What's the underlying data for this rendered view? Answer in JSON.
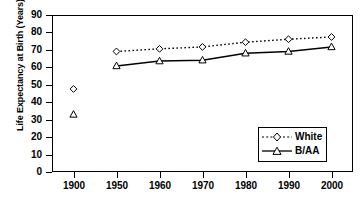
{
  "chart_data": {
    "type": "line",
    "title": "",
    "xlabel": "Year",
    "ylabel": "Life Expectancy at Birth (Years)",
    "categories": [
      "1900",
      "1950",
      "1960",
      "1970",
      "1980",
      "1990",
      "2000"
    ],
    "x_tick_labels": [
      "1900",
      "1950",
      "1960",
      "1970",
      "1980",
      "1990",
      "2000"
    ],
    "y_tick_labels": [
      "0",
      "10",
      "20",
      "30",
      "40",
      "50",
      "60",
      "70",
      "80",
      "90"
    ],
    "ylim": [
      0,
      90
    ],
    "y_tick_step": 10,
    "grid": false,
    "legend_position": "bottom-right",
    "series": [
      {
        "name": "White",
        "marker": "open-diamond",
        "line_style": "dotted",
        "color": "#000000",
        "values": [
          47.6,
          69.1,
          70.6,
          71.7,
          74.4,
          76.1,
          77.4
        ],
        "connected_from_index": 1
      },
      {
        "name": "B/AA",
        "marker": "open-triangle",
        "line_style": "solid",
        "color": "#000000",
        "values": [
          33.0,
          60.8,
          63.6,
          64.1,
          68.1,
          69.1,
          71.7
        ],
        "connected_from_index": 1
      }
    ]
  },
  "legend": {
    "entries": [
      {
        "label": "White"
      },
      {
        "label": "B/AA"
      }
    ]
  }
}
